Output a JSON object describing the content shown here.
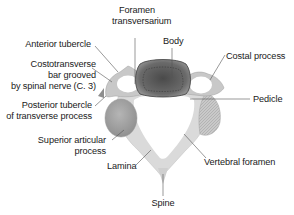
{
  "diagram": {
    "colors": {
      "background": "#ffffff",
      "text": "#1a1a1a",
      "leader_line": "#555555",
      "bone_light": "#d6d6d6",
      "bone_mid": "#a8a8a8",
      "body_dark": "#555555"
    },
    "labels": {
      "foramen_transversarium": {
        "line1": "Foramen",
        "line2": "transversarium"
      },
      "body": "Body",
      "anterior_tubercle": "Anterior tubercle",
      "costal_process": "Costal process",
      "costotransverse_bar": {
        "line1": "Costotransverse",
        "line2": "bar grooved",
        "line3": "by spinal nerve (C. 3)"
      },
      "pedicle": "Pedicle",
      "posterior_tubercle": {
        "line1": "Posterior tubercle",
        "line2": "of transverse process"
      },
      "superior_articular_process": {
        "line1": "Superior articular",
        "line2": "process"
      },
      "lamina": "Lamina",
      "vertebral_foramen": "Vertebral foramen",
      "spine": "Spine"
    }
  }
}
